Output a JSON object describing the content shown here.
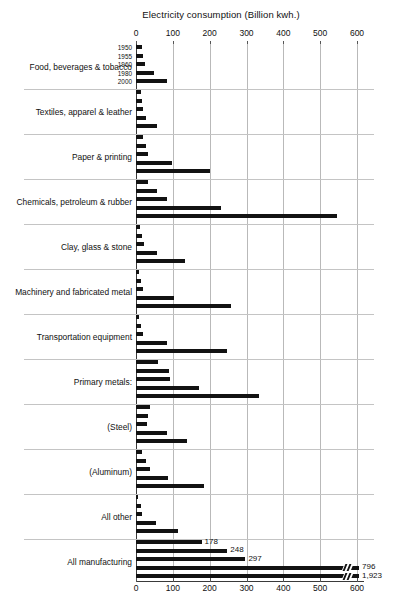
{
  "chart_data": {
    "type": "bar",
    "orientation": "horizontal",
    "title": "Electricity consumption (Billion kwh.)",
    "xlabel": "",
    "ylabel": "",
    "xlim": [
      0,
      600
    ],
    "xticks": [
      0,
      100,
      200,
      300,
      400,
      500,
      600
    ],
    "xtick_labels": [
      "0",
      "100",
      "200",
      "300",
      "400",
      "500",
      "600"
    ],
    "grid": true,
    "grid_axis": "x",
    "legend": "none",
    "series_labels": [
      "1950",
      "1955",
      "1960",
      "1980",
      "2000"
    ],
    "axis_position": "both",
    "bar_color": "#121212",
    "grid_color": "#b9b9b9",
    "categories": [
      "Food, beverages & tobacco",
      "Textiles, apparel & leather",
      "Paper & printing",
      "Chemicals, petroleum & rubber",
      "Clay, glass & stone",
      "Machinery and fabricated metal",
      "Transportation equipment",
      "Primary metals:",
      "(Steel)",
      "(Aluminum)",
      "All other",
      "All manufacturing"
    ],
    "series": [
      {
        "name": "1950",
        "values": [
          17,
          13,
          20,
          32,
          12,
          9,
          9,
          61,
          38,
          17,
          6,
          178
        ]
      },
      {
        "name": "1955",
        "values": [
          20,
          16,
          26,
          58,
          16,
          14,
          14,
          90,
          32,
          26,
          14,
          248
        ]
      },
      {
        "name": "1960",
        "values": [
          24,
          20,
          32,
          85,
          22,
          20,
          19,
          92,
          30,
          37,
          16,
          297
        ]
      },
      {
        "name": "1980",
        "values": [
          50,
          26,
          97,
          230,
          57,
          104,
          85,
          172,
          83,
          88,
          53,
          796
        ]
      },
      {
        "name": "2000",
        "values": [
          83,
          56,
          200,
          545,
          133,
          257,
          246,
          335,
          139,
          184,
          113,
          1923
        ]
      }
    ],
    "value_labels": {
      "All manufacturing": {
        "1950": "178",
        "1955": "248",
        "1960": "297",
        "1980": "796",
        "2000": "1,923"
      }
    }
  },
  "ticks": {
    "t0": "0",
    "t1": "100",
    "t2": "200",
    "t3": "300",
    "t4": "400",
    "t5": "500",
    "t6": "600"
  },
  "years": {
    "y1950": "1950",
    "y1955": "1955",
    "y1960": "1960",
    "y1980": "1980",
    "y2000": "2000"
  }
}
